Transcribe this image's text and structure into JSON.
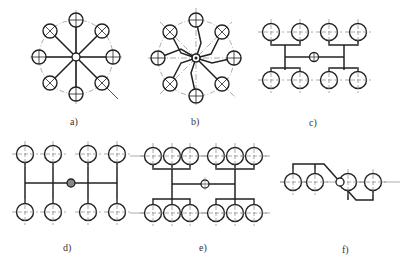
{
  "figure": {
    "panels": [
      {
        "id": "a",
        "label": "a)",
        "layout": "circular-radial",
        "circles": 8,
        "label_x": 70,
        "label_y": 116
      },
      {
        "id": "b",
        "label": "b)",
        "layout": "circular-branched",
        "circles": 8,
        "label_x": 191,
        "label_y": 116
      },
      {
        "id": "c",
        "label": "c)",
        "layout": "h-tree-2x4",
        "circles": 8,
        "label_x": 309,
        "label_y": 117
      },
      {
        "id": "d",
        "label": "d)",
        "layout": "comb-2x4",
        "circles": 8,
        "label_x": 63,
        "label_y": 242
      },
      {
        "id": "e",
        "label": "e)",
        "layout": "h-tree-2x6",
        "circles": 12,
        "label_x": 199,
        "label_y": 242
      },
      {
        "id": "f",
        "label": "f)",
        "layout": "linear-offset",
        "circles": 4,
        "label_x": 342,
        "label_y": 244
      }
    ]
  },
  "colors": {
    "stroke": "#222222",
    "center_line": "#888888",
    "background": "#ffffff"
  }
}
